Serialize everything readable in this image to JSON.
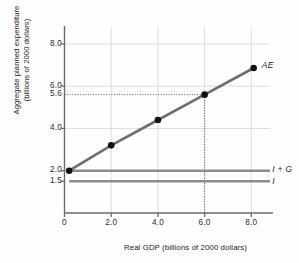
{
  "chart_data": {
    "type": "line",
    "title": "",
    "xlabel": "Real GDP (billions of 2000 dollars)",
    "ylabel_line1": "Aggregate planned expenditure",
    "ylabel_line2": "(billions of 2000 dollars)",
    "xlim": [
      0,
      8.8
    ],
    "ylim": [
      0,
      8.8
    ],
    "xticks": [
      "0",
      "2.0",
      "4.0",
      "6.0",
      "8.0"
    ],
    "xtick_values": [
      0,
      2.0,
      4.0,
      6.0,
      8.0
    ],
    "yticks": [
      "8.0",
      "6.0",
      "5.6",
      "4.0",
      "2.0",
      "1.5"
    ],
    "ytick_values": [
      8.0,
      6.0,
      5.6,
      4.0,
      2.0,
      1.5
    ],
    "grid": true,
    "legend": "inline-right",
    "series": [
      {
        "name": "AE",
        "label": "AE",
        "type": "line-with-markers",
        "color": "#6e6e6e",
        "marker_color": "#111111",
        "x": [
          0.2,
          2.0,
          4.0,
          6.0,
          8.1
        ],
        "values": [
          2.0,
          3.2,
          4.4,
          5.6,
          6.86
        ],
        "label_x": 8.45,
        "label_y": 7.0
      },
      {
        "name": "I + G",
        "label": "I + G",
        "type": "horizontal-line",
        "color": "#8c8c8c",
        "x": [
          0.2,
          8.8
        ],
        "values": [
          2.0,
          2.0
        ],
        "label_x": 8.9,
        "label_y": 2.05
      },
      {
        "name": "I",
        "label": "I",
        "type": "horizontal-line",
        "color": "#8c8c8c",
        "x": [
          0.2,
          8.8
        ],
        "values": [
          1.5,
          1.5
        ],
        "label_x": 8.9,
        "label_y": 1.5
      }
    ],
    "annotations": [
      {
        "name": "equilibrium-guide-horizontal",
        "style": "dotted",
        "from": [
          0,
          5.6
        ],
        "to": [
          6.0,
          5.6
        ],
        "color": "#555555"
      },
      {
        "name": "equilibrium-guide-vertical",
        "style": "dotted",
        "from": [
          6.0,
          5.6
        ],
        "to": [
          6.0,
          0
        ],
        "color": "#555555"
      }
    ],
    "colors": {
      "axis": "#6b6b6b",
      "grid": "#d9d9d9",
      "ae_line": "#6e6e6e",
      "flat_line": "#8c8c8c",
      "marker": "#111111",
      "text": "#1b1b1b",
      "background": "#fefefe"
    }
  }
}
